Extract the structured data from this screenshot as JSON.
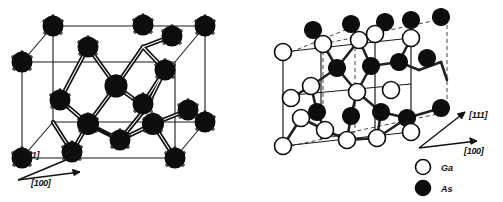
{
  "figure": {
    "background_color": "#ffffff",
    "panels": [
      {
        "id": "diamond-lattice",
        "structure_name": "diamond cubic",
        "atom_species": [
          "As"
        ],
        "atom_fill": "#0d0d0d",
        "directions": [
          {
            "label": "[111]",
            "x": 30,
            "y": 153
          },
          {
            "label": "[100]",
            "x": 36,
            "y": 178
          }
        ]
      },
      {
        "id": "zincblende-lattice",
        "structure_name": "zincblende GaAs",
        "atom_species": [
          "Ga",
          "As"
        ],
        "directions": [
          {
            "label": "[111]",
            "x": 218,
            "y": 118
          },
          {
            "label": "[100]",
            "x": 213,
            "y": 150
          }
        ],
        "legend": {
          "items": [
            {
              "symbol": "Ga",
              "label": "Ga",
              "fill": "#ffffff",
              "stroke": "#0d0d0d"
            },
            {
              "symbol": "As",
              "label": "As",
              "fill": "#0d0d0d",
              "stroke": "#0d0d0d"
            }
          ]
        }
      }
    ],
    "colors": {
      "atom_dark": "#0d0d0d",
      "atom_light": "#ffffff",
      "bond": "#1a1a1a",
      "cell_edge": "#1a1a1a",
      "cell_edge_hidden": "#3a3a3a"
    }
  }
}
